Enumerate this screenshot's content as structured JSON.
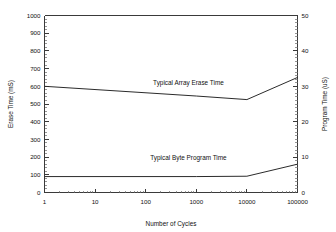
{
  "chart_data": {
    "type": "line",
    "title": "",
    "subtitle": "",
    "xlabel": "Number of Cycles",
    "ylabel": "Erase Time (mS)",
    "y2label": "Program Time (uS)",
    "xscale": "log",
    "xlim": [
      1,
      100000
    ],
    "ylim": [
      0,
      1000
    ],
    "y2lim": [
      0,
      50
    ],
    "grid": false,
    "legend_position": "inline-annotation",
    "xticks": [
      1,
      10,
      100,
      1000,
      10000,
      100000
    ],
    "xticklabels": [
      "1",
      "10",
      "100",
      "1000",
      "10000",
      "100000"
    ],
    "yticks": [
      0,
      100,
      200,
      300,
      400,
      500,
      600,
      700,
      800,
      900,
      1000
    ],
    "yticklabels": [
      "0",
      "100",
      "200",
      "300",
      "400",
      "500",
      "600",
      "700",
      "800",
      "900",
      "1000"
    ],
    "y2ticks": [
      0,
      10,
      20,
      30,
      40,
      50
    ],
    "y2ticklabels": [
      "0",
      "10",
      "20",
      "30",
      "40",
      "50"
    ],
    "series": [
      {
        "name": "Typical Array Erase Time",
        "axis": "left",
        "units": "mS",
        "x": [
          1,
          1000,
          10000,
          100000
        ],
        "values": [
          600,
          545,
          525,
          650
        ]
      },
      {
        "name": "Typical Byte Program Time",
        "axis": "left",
        "units": "mS",
        "x": [
          1,
          1000,
          10000,
          100000
        ],
        "values": [
          90,
          90,
          92,
          160
        ]
      }
    ],
    "annotations": [
      {
        "text": "Typical Array Erase Time",
        "x": 700,
        "y": 610
      },
      {
        "text": "Typical Byte Program Time",
        "x": 700,
        "y": 185
      }
    ],
    "colors": {
      "line": "#2b2b2b",
      "axis": "#3a3a3a",
      "background": "#ffffff",
      "text": "#111111"
    }
  }
}
